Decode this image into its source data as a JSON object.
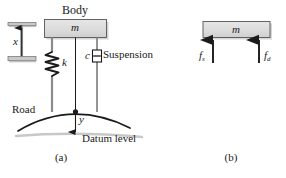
{
  "figure": {
    "panels": [
      {
        "id": "a",
        "caption": "(a)",
        "labels": {
          "body": "Body",
          "mass": "m",
          "displacement": "x",
          "spring": "k",
          "damper": "c",
          "suspension": "Suspension",
          "road": "Road",
          "road_displacement": "y",
          "datum": "Datum level"
        }
      },
      {
        "id": "b",
        "caption": "(b)",
        "labels": {
          "mass": "m",
          "spring_force": "f",
          "spring_force_sub": "s",
          "damper_force": "f",
          "damper_force_sub": "d"
        }
      }
    ],
    "colors": {
      "line": "#1a1a1a",
      "block_fill": "#d9d9d9",
      "block_edge": "#4d4d4d",
      "shadow": "#b3b3b3",
      "background": "#ffffff"
    }
  }
}
